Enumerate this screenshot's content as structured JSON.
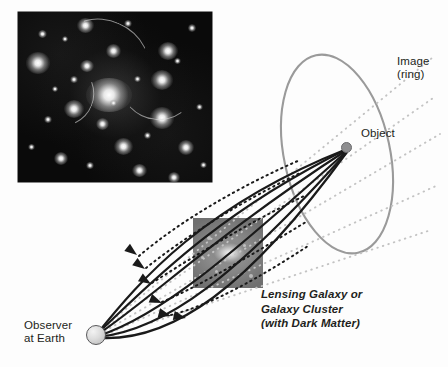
{
  "diagram": {
    "background_color": "#fdfdfd"
  },
  "labels": {
    "image_ring": "Image\n(ring)",
    "object": "Object",
    "observer": "Observer\nat Earth",
    "lensing": "Lensing Galaxy or\nGalaxy Cluster\n(with Dark Matter)"
  },
  "colors": {
    "text": "#231f20",
    "ray_solid": "#1a1a1a",
    "ray_dotted": "#c3c3c3",
    "ring_stroke": "#9a9a9a",
    "object_fill": "#8e8e90",
    "observer_fill": "#dcdcdc",
    "photo_background": "#0a0a0a",
    "lens_inset": "#8a8a8a"
  },
  "elements": {
    "cluster_photo_alt": "Hubble image of a galaxy cluster with lensed arcs",
    "lens_inset_alt": "Close-up image of the lensing galaxy",
    "ring_shape": "ellipse",
    "ray_count": 6,
    "arrowhead_count": 6,
    "dotted_line_count": 5
  },
  "geometry": {
    "observer_point": [
      96,
      335
    ],
    "object_point": [
      347,
      148
    ],
    "ring_center": [
      337,
      154
    ],
    "ring_radius_x": 53,
    "ring_radius_y": 101,
    "ring_rotation_deg": -12
  }
}
